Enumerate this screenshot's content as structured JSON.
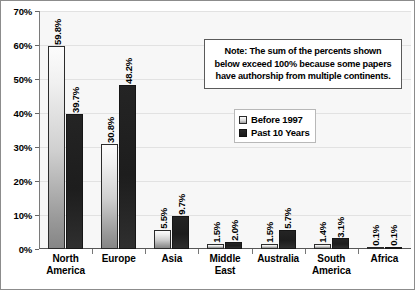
{
  "chart_data": {
    "type": "bar",
    "title": "",
    "xlabel": "",
    "ylabel": "",
    "ylim": [
      0,
      70
    ],
    "ytick_labels": [
      "0%",
      "10%",
      "20%",
      "30%",
      "40%",
      "50%",
      "60%",
      "70%"
    ],
    "ytick_values": [
      0,
      10,
      20,
      30,
      40,
      50,
      60,
      70
    ],
    "grid": true,
    "legend_position": "inside-upper-right",
    "categories": [
      "North America",
      "Europe",
      "Asia",
      "Middle East",
      "Australia",
      "South America",
      "Africa"
    ],
    "category_lines": [
      [
        "North",
        "America"
      ],
      [
        "Europe"
      ],
      [
        "Asia"
      ],
      [
        "Middle",
        "East"
      ],
      [
        "Australia"
      ],
      [
        "South",
        "America"
      ],
      [
        "Africa"
      ]
    ],
    "series": [
      {
        "name": "Before 1997",
        "values": [
          59.8,
          30.8,
          5.5,
          1.5,
          1.5,
          1.4,
          0.1
        ],
        "labels": [
          "59.8%",
          "30.8%",
          "5.5%",
          "1.5%",
          "1.5%",
          "1.4%",
          "0.1%"
        ],
        "color": "#e0e0e0"
      },
      {
        "name": "Past 10 Years",
        "values": [
          39.7,
          48.2,
          9.7,
          2.0,
          5.7,
          3.1,
          0.1
        ],
        "labels": [
          "39.7%",
          "48.2%",
          "9.7%",
          "2.0%",
          "5.7%",
          "3.1%",
          "0.1%"
        ],
        "color": "#1d1d1d"
      }
    ],
    "annotations": [
      "Note: The sum of the percents shown below exceed 100% because some papers have authorship from multiple continents."
    ]
  },
  "note": {
    "line1": "Note: The sum of the percents shown",
    "line2": "below exceed 100% because some papers",
    "line3": "have authorship from multiple continents."
  },
  "legend": {
    "items": [
      {
        "label": "Before 1997"
      },
      {
        "label": "Past 10 Years"
      }
    ]
  }
}
